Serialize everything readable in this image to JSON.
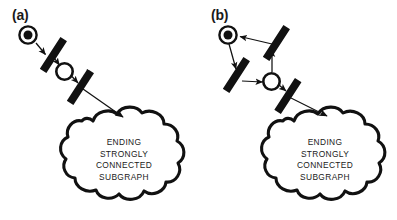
{
  "figure": {
    "width": 397,
    "height": 220,
    "background": "#ffffff",
    "ink_color": "#111111",
    "caption_color": "#1a1a1a"
  },
  "panels": [
    {
      "id": "a",
      "label": "(a)",
      "description": "Acyclic initial segment: marked place feeds a chain of two transitions and one intermediate place, then an arc enters the ending strongly connected subgraph.",
      "nodes": {
        "initial_place": {
          "type": "place",
          "tokens": 1,
          "token_glyph": "filled-circle"
        },
        "transition_1": {
          "type": "transition",
          "shape": "thick-bar"
        },
        "middle_place": {
          "type": "place",
          "tokens": 0
        },
        "transition_2": {
          "type": "transition",
          "shape": "thick-bar"
        }
      },
      "arcs": [
        {
          "from": "initial_place",
          "to": "transition_1"
        },
        {
          "from": "transition_1",
          "to": "middle_place"
        },
        {
          "from": "middle_place",
          "to": "transition_2"
        },
        {
          "from": "transition_2",
          "to": "cloud"
        }
      ],
      "cloud": {
        "lines": [
          "ENDING",
          "STRONGLY",
          "CONNECTED",
          "SUBGRAPH"
        ]
      }
    },
    {
      "id": "b",
      "label": "(b)",
      "description": "Cyclic initial segment: marked place, lower-left transition, middle place and upper transition form a directed cycle; a further transition leads out into the ending strongly connected subgraph.",
      "nodes": {
        "initial_place": {
          "type": "place",
          "tokens": 1,
          "token_glyph": "filled-circle"
        },
        "transition_top": {
          "type": "transition",
          "shape": "thick-bar"
        },
        "transition_left": {
          "type": "transition",
          "shape": "thick-bar"
        },
        "middle_place": {
          "type": "place",
          "tokens": 0
        },
        "transition_exit": {
          "type": "transition",
          "shape": "thick-bar"
        }
      },
      "arcs": [
        {
          "from": "initial_place",
          "to": "transition_left"
        },
        {
          "from": "transition_left",
          "to": "middle_place"
        },
        {
          "from": "middle_place",
          "to": "transition_top"
        },
        {
          "from": "transition_top",
          "to": "initial_place"
        },
        {
          "from": "middle_place",
          "to": "transition_exit"
        },
        {
          "from": "transition_exit",
          "to": "cloud"
        }
      ],
      "cloud": {
        "lines": [
          "ENDING",
          "STRONGLY",
          "CONNECTED",
          "SUBGRAPH"
        ]
      }
    }
  ]
}
